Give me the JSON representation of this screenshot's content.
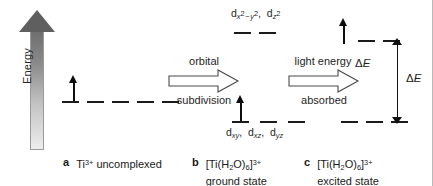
{
  "figure": {
    "type": "crystal-field-splitting-diagram",
    "axis": {
      "label": "Energy",
      "direction": "up"
    }
  },
  "panels": [
    {
      "id": "a",
      "letter": "a",
      "caption_line1": "Ti3+ uncomplexed",
      "caption_species": "Ti",
      "caption_charge": "3+",
      "caption_rest": " uncomplexed",
      "caption_line2": "",
      "levels": [
        {
          "set": "d",
          "label": "",
          "orbital_count": 5,
          "electrons": [
            1,
            0,
            0,
            0,
            0
          ],
          "relative_energy": "degenerate"
        }
      ]
    },
    {
      "id": "b",
      "letter": "b",
      "caption_species": "[Ti(H",
      "caption_line2": "ground state",
      "levels": [
        {
          "set": "eg",
          "orbital_count": 2,
          "electrons": [
            0,
            0
          ],
          "relative_energy": "upper"
        },
        {
          "set": "t2g",
          "orbital_count": 3,
          "electrons": [
            1,
            0,
            0
          ],
          "relative_energy": "lower"
        }
      ]
    },
    {
      "id": "c",
      "letter": "c",
      "caption_line2": "excited state",
      "levels": [
        {
          "set": "eg",
          "orbital_count": 2,
          "electrons": [
            1,
            0
          ],
          "relative_energy": "upper"
        },
        {
          "set": "t2g",
          "orbital_count": 3,
          "electrons": [
            0,
            0,
            0
          ],
          "relative_energy": "lower"
        }
      ]
    }
  ],
  "labels": {
    "eg_orbitals": "dx2-y2, dz2",
    "t2g_orbitals": "dxy, dxz, dyz",
    "delta_e": "ΔE",
    "delta_symbol": "Δ",
    "energy_axis": "Energy"
  },
  "process_arrows": [
    {
      "id": "orbital-subdivision",
      "top_label": "orbital",
      "bottom_label": "subdivision"
    },
    {
      "id": "light-absorption",
      "top_label": "light energy",
      "bottom_label": "absorbed",
      "tip_label": "ΔE"
    }
  ],
  "captions": {
    "a": {
      "letter": "a",
      "text": "Ti",
      "sup": "3+",
      "tail": " uncomplexed",
      "line2": ""
    },
    "b": {
      "letter": "b",
      "pre": "[Ti(H",
      "sub1": "2",
      "mid": "O)",
      "sub2": "6",
      "close": "]",
      "sup": "3+",
      "line2": "ground state"
    },
    "c": {
      "letter": "c",
      "pre": "[Ti(H",
      "sub1": "2",
      "mid": "O)",
      "sub2": "6",
      "close": "]",
      "sup": "3+",
      "line2": "excited state"
    }
  },
  "colors": {
    "ink": "#1a1a1a",
    "level_line": "#1b1b1b",
    "arrow_top": "#5f5f5f",
    "arrow_bottom": "#ededed",
    "border": "#b9b9b9"
  }
}
